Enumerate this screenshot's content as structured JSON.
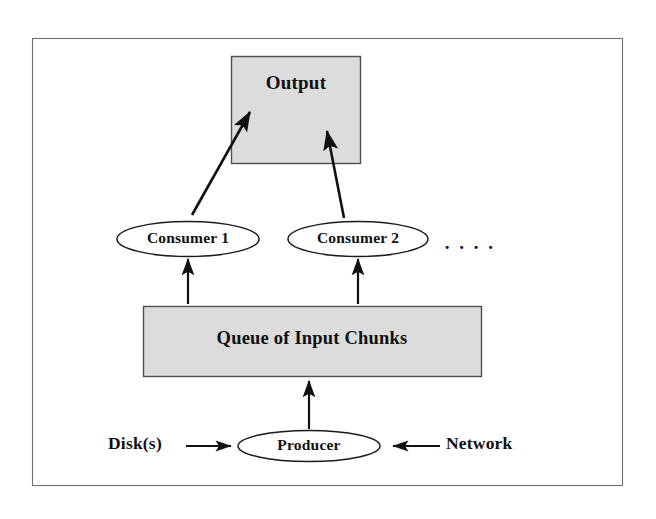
{
  "diagram": {
    "frame": {
      "name": "outer-frame",
      "stroke": "#6d6d6d",
      "fill": "#ffffff"
    },
    "colors": {
      "box_fill": "#dcdcdc",
      "box_stroke": "#555555",
      "ellipse_fill": "#ffffff",
      "ellipse_stroke": "#1a1a1a",
      "arrow": "#111111",
      "text": "#101010",
      "page_background": "#ffffff"
    },
    "nodes": {
      "output": {
        "label": "Output",
        "shape": "rectangle"
      },
      "consumer_1": {
        "label": "Consumer  1",
        "shape": "ellipse"
      },
      "consumer_2": {
        "label": "Consumer  2",
        "shape": "ellipse"
      },
      "more_consumers": {
        "label": ". . . .",
        "shape": "text"
      },
      "queue": {
        "label": "Queue of Input Chunks",
        "shape": "rectangle"
      },
      "producer": {
        "label": "Producer",
        "shape": "ellipse"
      },
      "disk": {
        "label": "Disk(s)",
        "shape": "text"
      },
      "network": {
        "label": "Network",
        "shape": "text"
      }
    },
    "edges": [
      {
        "name": "consumer-1-to-output",
        "from": "consumer_1",
        "to": "output",
        "style": "arrow"
      },
      {
        "name": "consumer-2-to-output",
        "from": "consumer_2",
        "to": "output",
        "style": "arrow"
      },
      {
        "name": "queue-to-consumer-1",
        "from": "queue",
        "to": "consumer_1",
        "style": "arrow"
      },
      {
        "name": "queue-to-consumer-2",
        "from": "queue",
        "to": "consumer_2",
        "style": "arrow"
      },
      {
        "name": "producer-to-queue",
        "from": "producer",
        "to": "queue",
        "style": "arrow"
      },
      {
        "name": "disk-to-producer",
        "from": "disk",
        "to": "producer",
        "style": "arrow"
      },
      {
        "name": "network-to-producer",
        "from": "network",
        "to": "producer",
        "style": "arrow"
      }
    ]
  }
}
